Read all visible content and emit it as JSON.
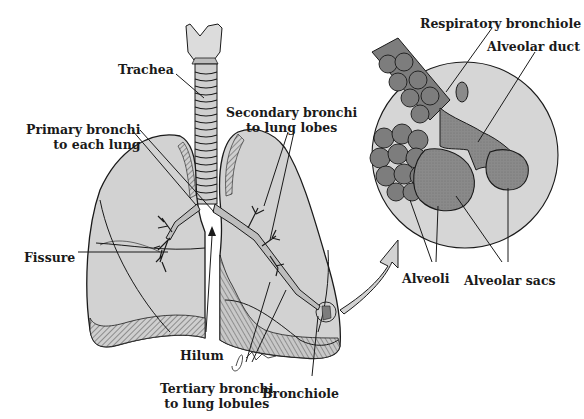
{
  "diagram": {
    "colors": {
      "lung_fill": "#d2d2d2",
      "lung_shade": "#b9b9b9",
      "outline": "#1a1a1a",
      "magnify_circle": "#d6d6d6",
      "alveoli_fill": "#7d7d7d",
      "alveolar_sac_fill": "#8a8a8a",
      "background": "#ffffff"
    },
    "labels": {
      "trachea": "Trachea",
      "primary_bronchi": [
        "Primary bronchi",
        "to each lung"
      ],
      "secondary_bronchi": [
        "Secondary bronchi",
        "to lung lobes"
      ],
      "fissure": "Fissure",
      "hilum": "Hilum",
      "tertiary_bronchi": [
        "Tertiary bronchi",
        "to lung lobules"
      ],
      "bronchiole": "Bronchiole",
      "respiratory_bronchiole": "Respiratory bronchiole",
      "alveolar_duct": "Alveolar duct",
      "alveoli": "Alveoli",
      "alveolar_sacs": "Alveolar sacs"
    },
    "artist_signature": "J Fults"
  }
}
